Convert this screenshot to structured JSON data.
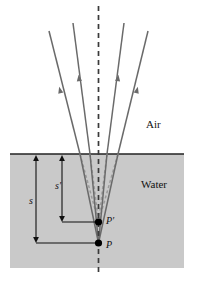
{
  "figure": {
    "regions": [
      {
        "name": "air",
        "label": "Air",
        "fill": "#ffffff",
        "label_x": 146,
        "label_y": 119
      },
      {
        "name": "water",
        "label": "Water",
        "fill": "#c9c9c9",
        "label_x": 141,
        "label_y": 179
      }
    ],
    "surface": {
      "y": 154,
      "x1": 10,
      "x2": 184,
      "color": "#222222"
    },
    "axis": {
      "name": "normal-dashed-axis",
      "x": 98.5,
      "y1": 6,
      "y2": 272,
      "color": "#3a3a3a",
      "dash": "5,4"
    },
    "points": [
      {
        "name": "P-prime",
        "label": "P′",
        "x": 98.5,
        "y": 222,
        "label_x": 106,
        "label_y": 216
      },
      {
        "name": "P",
        "label": "P",
        "x": 98.5,
        "y": 243,
        "label_x": 106,
        "label_y": 240
      }
    ],
    "dimensions": [
      {
        "name": "s",
        "label": "s",
        "x": 36,
        "y_top": 155,
        "y_bottom": 243,
        "label_x": 29,
        "label_y": 196,
        "connector_x2": 98.5
      },
      {
        "name": "s-prime",
        "label": "s′",
        "x": 62,
        "y_top": 155,
        "y_bottom": 222,
        "label_x": 55,
        "label_y": 181,
        "connector_x2": 98.5
      }
    ],
    "rays": {
      "count": 4,
      "color": "#6a6a6a",
      "virtual_color": "#9a9a9a",
      "water_paths": [
        {
          "name": "ray-1-water",
          "x_surface": 80,
          "y_surface": 154,
          "x_source": 98.5,
          "y_source": 243
        },
        {
          "name": "ray-2-water",
          "x_surface": 90,
          "y_surface": 154,
          "x_source": 98.5,
          "y_source": 243
        },
        {
          "name": "ray-3-water",
          "x_surface": 107,
          "y_surface": 154,
          "x_source": 98.5,
          "y_source": 243
        },
        {
          "name": "ray-4-water",
          "x_surface": 118,
          "y_surface": 154,
          "x_source": 98.5,
          "y_source": 243
        }
      ],
      "air_paths": [
        {
          "name": "ray-1-air",
          "x_surface": 80,
          "y_surface": 154,
          "x_end": 49,
          "y_end": 31
        },
        {
          "name": "ray-2-air",
          "x_surface": 90,
          "y_surface": 154,
          "x_end": 73,
          "y_end": 23
        },
        {
          "name": "ray-3-air",
          "x_surface": 107,
          "y_surface": 154,
          "x_end": 124,
          "y_end": 23
        },
        {
          "name": "ray-4-air",
          "x_surface": 118,
          "y_surface": 154,
          "x_end": 148,
          "y_end": 31
        }
      ],
      "virtual_paths": [
        {
          "name": "virtual-1",
          "x_surface": 80,
          "y_surface": 154,
          "x_image": 98.5,
          "y_image": 222
        },
        {
          "name": "virtual-2",
          "x_surface": 90,
          "y_surface": 154,
          "x_image": 98.5,
          "y_image": 222
        },
        {
          "name": "virtual-3",
          "x_surface": 107,
          "y_surface": 154,
          "x_image": 98.5,
          "y_image": 222
        },
        {
          "name": "virtual-4",
          "x_surface": 118,
          "y_surface": 154,
          "x_image": 98.5,
          "y_image": 222
        }
      ],
      "arrow_markers": [
        {
          "name": "arrow-ray-1",
          "x": 60,
          "y": 90
        },
        {
          "name": "arrow-ray-2",
          "x": 79,
          "y": 78
        },
        {
          "name": "arrow-ray-3",
          "x": 118,
          "y": 78
        },
        {
          "name": "arrow-ray-4",
          "x": 137,
          "y": 90
        }
      ]
    }
  }
}
